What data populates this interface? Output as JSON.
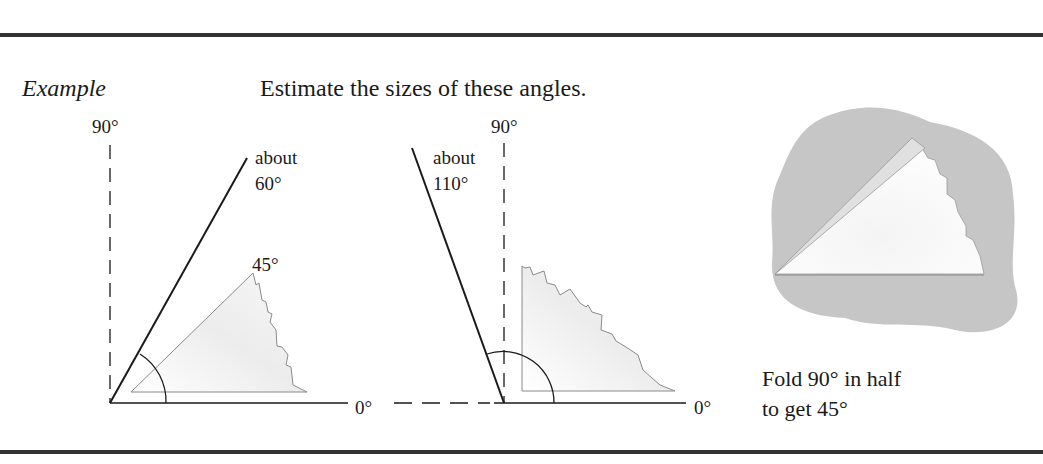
{
  "header": {
    "example_label": "Example",
    "instruction": "Estimate the sizes of these angles."
  },
  "diagram_left": {
    "axis_top_label": "90°",
    "axis_right_label": "0°",
    "angle_label_line1": "about",
    "angle_label_line2": "60°",
    "reference_label": "45°"
  },
  "diagram_middle": {
    "axis_top_label": "90°",
    "axis_right_label": "0°",
    "angle_label_line1": "about",
    "angle_label_line2": "110°"
  },
  "diagram_right": {
    "caption_line1": "Fold 90° in half",
    "caption_line2": "to get 45°"
  },
  "colors": {
    "rule": "#333333",
    "paper_shadow": "#c8c8c8",
    "paper_fill": "#eeeeee",
    "line": "#1a1a1a",
    "ref_line": "#8a8a8a"
  }
}
